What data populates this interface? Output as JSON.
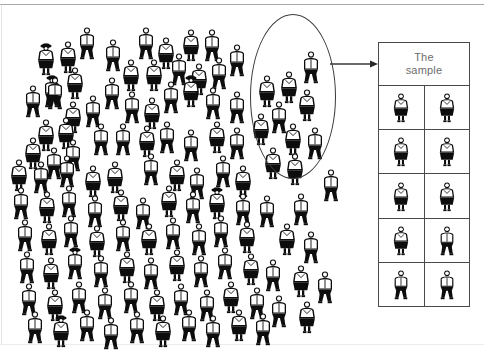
{
  "diagram": {
    "title_text": "The\nsample",
    "ink_color": "#0d0d0d",
    "line_color": "#4a4a4a",
    "label_color": "#6d6d6d",
    "background": "#ffffff",
    "ellipse_label": "selected-sample-ellipse",
    "arrow_label": "sample-arrow"
  },
  "population": {
    "name": "population-crowd",
    "total_figures": 118,
    "figures": [
      {
        "x": 35,
        "y": 34,
        "type": "female",
        "hat": true
      },
      {
        "x": 57,
        "y": 32,
        "type": "female",
        "hat": false
      },
      {
        "x": 76,
        "y": 18,
        "type": "male",
        "hat": false
      },
      {
        "x": 102,
        "y": 30,
        "type": "male",
        "hat": false
      },
      {
        "x": 135,
        "y": 18,
        "type": "male",
        "hat": false
      },
      {
        "x": 155,
        "y": 28,
        "type": "female",
        "hat": false
      },
      {
        "x": 180,
        "y": 20,
        "type": "female",
        "hat": false
      },
      {
        "x": 201,
        "y": 20,
        "type": "male",
        "hat": false
      },
      {
        "x": 226,
        "y": 35,
        "type": "male",
        "hat": false
      },
      {
        "x": 64,
        "y": 58,
        "type": "female",
        "hat": false
      },
      {
        "x": 41,
        "y": 66,
        "type": "male",
        "hat": true
      },
      {
        "x": 120,
        "y": 50,
        "type": "female",
        "hat": false
      },
      {
        "x": 143,
        "y": 50,
        "type": "female",
        "hat": false
      },
      {
        "x": 168,
        "y": 44,
        "type": "male",
        "hat": false
      },
      {
        "x": 188,
        "y": 54,
        "type": "female",
        "hat": false
      },
      {
        "x": 208,
        "y": 48,
        "type": "male",
        "hat": false
      },
      {
        "x": 22,
        "y": 76,
        "type": "male",
        "hat": false
      },
      {
        "x": 44,
        "y": 68,
        "type": "male",
        "hat": false
      },
      {
        "x": 101,
        "y": 68,
        "type": "male",
        "hat": false
      },
      {
        "x": 160,
        "y": 72,
        "type": "male",
        "hat": false
      },
      {
        "x": 180,
        "y": 66,
        "type": "female",
        "hat": true
      },
      {
        "x": 202,
        "y": 78,
        "type": "male",
        "hat": false
      },
      {
        "x": 226,
        "y": 82,
        "type": "male",
        "hat": false
      },
      {
        "x": 62,
        "y": 92,
        "type": "female",
        "hat": false
      },
      {
        "x": 82,
        "y": 86,
        "type": "male",
        "hat": false
      },
      {
        "x": 121,
        "y": 82,
        "type": "male",
        "hat": false
      },
      {
        "x": 141,
        "y": 88,
        "type": "female",
        "hat": false
      },
      {
        "x": 35,
        "y": 110,
        "type": "female",
        "hat": false
      },
      {
        "x": 55,
        "y": 108,
        "type": "female",
        "hat": false
      },
      {
        "x": 22,
        "y": 128,
        "type": "female",
        "hat": false
      },
      {
        "x": 43,
        "y": 138,
        "type": "male",
        "hat": false
      },
      {
        "x": 62,
        "y": 130,
        "type": "male",
        "hat": false
      },
      {
        "x": 90,
        "y": 114,
        "type": "male",
        "hat": false
      },
      {
        "x": 112,
        "y": 114,
        "type": "male",
        "hat": false
      },
      {
        "x": 136,
        "y": 116,
        "type": "female",
        "hat": false
      },
      {
        "x": 156,
        "y": 112,
        "type": "male",
        "hat": false
      },
      {
        "x": 180,
        "y": 120,
        "type": "male",
        "hat": false
      },
      {
        "x": 206,
        "y": 112,
        "type": "female",
        "hat": false
      },
      {
        "x": 226,
        "y": 118,
        "type": "male",
        "hat": false
      },
      {
        "x": 8,
        "y": 150,
        "type": "female",
        "hat": false
      },
      {
        "x": 30,
        "y": 152,
        "type": "male",
        "hat": false
      },
      {
        "x": 56,
        "y": 146,
        "type": "male",
        "hat": false
      },
      {
        "x": 82,
        "y": 156,
        "type": "female",
        "hat": false
      },
      {
        "x": 104,
        "y": 152,
        "type": "female",
        "hat": false
      },
      {
        "x": 140,
        "y": 144,
        "type": "male",
        "hat": false
      },
      {
        "x": 166,
        "y": 150,
        "type": "female",
        "hat": false
      },
      {
        "x": 186,
        "y": 158,
        "type": "male",
        "hat": false
      },
      {
        "x": 212,
        "y": 146,
        "type": "male",
        "hat": false
      },
      {
        "x": 232,
        "y": 156,
        "type": "female",
        "hat": false
      },
      {
        "x": 10,
        "y": 178,
        "type": "male",
        "hat": false
      },
      {
        "x": 36,
        "y": 182,
        "type": "female",
        "hat": false
      },
      {
        "x": 58,
        "y": 176,
        "type": "male",
        "hat": false
      },
      {
        "x": 84,
        "y": 186,
        "type": "male",
        "hat": false
      },
      {
        "x": 110,
        "y": 180,
        "type": "female",
        "hat": false
      },
      {
        "x": 132,
        "y": 188,
        "type": "male",
        "hat": false
      },
      {
        "x": 158,
        "y": 176,
        "type": "female",
        "hat": false
      },
      {
        "x": 182,
        "y": 182,
        "type": "male",
        "hat": false
      },
      {
        "x": 206,
        "y": 178,
        "type": "female",
        "hat": true
      },
      {
        "x": 232,
        "y": 184,
        "type": "male",
        "hat": false
      },
      {
        "x": 14,
        "y": 210,
        "type": "male",
        "hat": false
      },
      {
        "x": 38,
        "y": 214,
        "type": "female",
        "hat": false
      },
      {
        "x": 60,
        "y": 206,
        "type": "male",
        "hat": false
      },
      {
        "x": 86,
        "y": 216,
        "type": "female",
        "hat": false
      },
      {
        "x": 112,
        "y": 210,
        "type": "male",
        "hat": false
      },
      {
        "x": 138,
        "y": 214,
        "type": "female",
        "hat": false
      },
      {
        "x": 162,
        "y": 208,
        "type": "male",
        "hat": false
      },
      {
        "x": 188,
        "y": 214,
        "type": "male",
        "hat": false
      },
      {
        "x": 210,
        "y": 206,
        "type": "male",
        "hat": false
      },
      {
        "x": 236,
        "y": 212,
        "type": "female",
        "hat": false
      },
      {
        "x": 16,
        "y": 242,
        "type": "male",
        "hat": false
      },
      {
        "x": 40,
        "y": 248,
        "type": "female",
        "hat": false
      },
      {
        "x": 64,
        "y": 238,
        "type": "male",
        "hat": true
      },
      {
        "x": 90,
        "y": 246,
        "type": "male",
        "hat": false
      },
      {
        "x": 116,
        "y": 242,
        "type": "female",
        "hat": false
      },
      {
        "x": 140,
        "y": 248,
        "type": "male",
        "hat": false
      },
      {
        "x": 166,
        "y": 240,
        "type": "female",
        "hat": false
      },
      {
        "x": 190,
        "y": 246,
        "type": "male",
        "hat": false
      },
      {
        "x": 214,
        "y": 238,
        "type": "male",
        "hat": false
      },
      {
        "x": 240,
        "y": 244,
        "type": "female",
        "hat": false
      },
      {
        "x": 18,
        "y": 274,
        "type": "male",
        "hat": false
      },
      {
        "x": 44,
        "y": 280,
        "type": "female",
        "hat": false
      },
      {
        "x": 68,
        "y": 272,
        "type": "male",
        "hat": false
      },
      {
        "x": 94,
        "y": 278,
        "type": "male",
        "hat": false
      },
      {
        "x": 120,
        "y": 272,
        "type": "male",
        "hat": false
      },
      {
        "x": 146,
        "y": 280,
        "type": "female",
        "hat": false
      },
      {
        "x": 170,
        "y": 274,
        "type": "male",
        "hat": false
      },
      {
        "x": 196,
        "y": 280,
        "type": "male",
        "hat": false
      },
      {
        "x": 220,
        "y": 272,
        "type": "female",
        "hat": false
      },
      {
        "x": 246,
        "y": 278,
        "type": "male",
        "hat": false
      },
      {
        "x": 24,
        "y": 302,
        "type": "male",
        "hat": false
      },
      {
        "x": 50,
        "y": 306,
        "type": "female",
        "hat": true
      },
      {
        "x": 76,
        "y": 300,
        "type": "male",
        "hat": false
      },
      {
        "x": 100,
        "y": 308,
        "type": "male",
        "hat": false
      },
      {
        "x": 126,
        "y": 302,
        "type": "male",
        "hat": false
      },
      {
        "x": 152,
        "y": 306,
        "type": "female",
        "hat": false
      },
      {
        "x": 178,
        "y": 300,
        "type": "male",
        "hat": false
      },
      {
        "x": 202,
        "y": 306,
        "type": "male",
        "hat": false
      },
      {
        "x": 228,
        "y": 300,
        "type": "female",
        "hat": false
      },
      {
        "x": 252,
        "y": 304,
        "type": "male",
        "hat": false
      },
      {
        "x": 256,
        "y": 66,
        "type": "female",
        "hat": false
      },
      {
        "x": 278,
        "y": 62,
        "type": "female",
        "hat": false
      },
      {
        "x": 300,
        "y": 42,
        "type": "male",
        "hat": false
      },
      {
        "x": 296,
        "y": 80,
        "type": "female",
        "hat": false
      },
      {
        "x": 268,
        "y": 92,
        "type": "male",
        "hat": false
      },
      {
        "x": 250,
        "y": 104,
        "type": "female",
        "hat": false
      },
      {
        "x": 282,
        "y": 114,
        "type": "female",
        "hat": false
      },
      {
        "x": 304,
        "y": 118,
        "type": "male",
        "hat": false
      },
      {
        "x": 262,
        "y": 138,
        "type": "female",
        "hat": false
      },
      {
        "x": 284,
        "y": 144,
        "type": "female",
        "hat": false
      },
      {
        "x": 256,
        "y": 186,
        "type": "male",
        "hat": false
      },
      {
        "x": 290,
        "y": 184,
        "type": "male",
        "hat": false
      },
      {
        "x": 276,
        "y": 214,
        "type": "female",
        "hat": false
      },
      {
        "x": 300,
        "y": 222,
        "type": "male",
        "hat": false
      },
      {
        "x": 262,
        "y": 250,
        "type": "male",
        "hat": false
      },
      {
        "x": 290,
        "y": 256,
        "type": "female",
        "hat": false
      },
      {
        "x": 268,
        "y": 286,
        "type": "male",
        "hat": false
      },
      {
        "x": 296,
        "y": 292,
        "type": "female",
        "hat": false
      },
      {
        "x": 314,
        "y": 262,
        "type": "male",
        "hat": false
      },
      {
        "x": 320,
        "y": 160,
        "type": "male",
        "hat": false
      }
    ]
  },
  "sample_box": {
    "name": "the-sample-box",
    "title": "The\nsample",
    "rows": 5,
    "cols": 2,
    "cells": [
      [
        {
          "type": "female",
          "hat": false
        },
        {
          "type": "female",
          "hat": false
        }
      ],
      [
        {
          "type": "female",
          "hat": false
        },
        {
          "type": "female",
          "hat": false
        }
      ],
      [
        {
          "type": "female",
          "hat": false
        },
        {
          "type": "female",
          "hat": false
        }
      ],
      [
        {
          "type": "female",
          "hat": false
        },
        {
          "type": "male",
          "hat": false
        }
      ],
      [
        {
          "type": "male",
          "hat": false
        },
        {
          "type": "male",
          "hat": false
        }
      ]
    ]
  }
}
